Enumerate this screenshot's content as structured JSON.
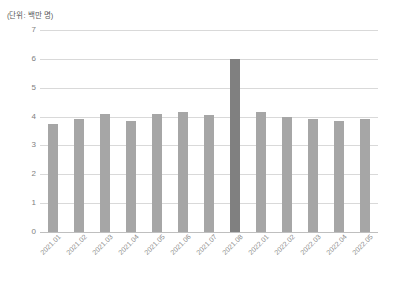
{
  "chart_data": {
    "type": "bar",
    "title": "",
    "subtitle": "",
    "unit_label": "(단위: 백만 명)",
    "xlabel": "",
    "ylabel": "",
    "ylim": [
      0,
      7
    ],
    "ytick_values": [
      7,
      6,
      5,
      4,
      3,
      2,
      1,
      0
    ],
    "ytick_labels": [
      "7",
      "6",
      "5",
      "4",
      "3",
      "2",
      "1",
      "0"
    ],
    "grid": true,
    "legend": "none",
    "categories": [
      "2021.01",
      "2021.02",
      "2021.03",
      "2021.04",
      "2021.05",
      "2021.06",
      "2021.07",
      "2021.08",
      "2022.01",
      "2022.02",
      "2022.03",
      "2022.04",
      "2022.05"
    ],
    "values": [
      3.75,
      3.9,
      4.1,
      3.85,
      4.1,
      4.17,
      4.05,
      6.0,
      4.15,
      4.0,
      3.93,
      3.85,
      3.92
    ],
    "highlight_index": 7,
    "bar_color": "#a6a6a6",
    "highlight_color": "#808080",
    "gridline_color": "#d9d9d9",
    "axis_color": "#bfbfbf",
    "tick_text_color": "#808080"
  }
}
